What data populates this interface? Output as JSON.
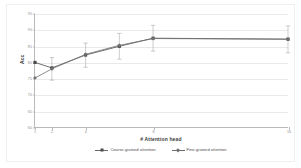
{
  "chart_data": {
    "type": "line",
    "title": "",
    "xlabel": "# Attention head",
    "ylabel": "Acc",
    "x": [
      1,
      2,
      4,
      6,
      8,
      16
    ],
    "xtick_labels": [
      "1",
      "2",
      "4",
      "8",
      "16"
    ],
    "xtick_positions": [
      1,
      2,
      4,
      8,
      16
    ],
    "ylim": [
      60,
      95
    ],
    "ytick_labels": [
      "95",
      "90",
      "85",
      "80",
      "75",
      "70",
      "65",
      "60"
    ],
    "ytick_values": [
      95,
      90,
      85,
      80,
      75,
      70,
      65,
      60
    ],
    "grid": true,
    "legend_position": "bottom",
    "series": [
      {
        "name": "Coarse-grained attention",
        "marker": "square",
        "color": "#4a4a4a",
        "values": [
          80.0,
          78.3,
          82.3,
          85.0,
          87.5,
          87.2
        ],
        "error_low": [
          80.0,
          74.5,
          78.5,
          81.0,
          83.5,
          83.0
        ],
        "error_high": [
          80.0,
          81.5,
          86.0,
          89.0,
          91.5,
          91.3
        ]
      },
      {
        "name": "Fine-grained attention",
        "marker": "diamond",
        "color": "#707070",
        "values": [
          75.2,
          78.0,
          82.5,
          85.3,
          87.4,
          87.2
        ],
        "error_low": [
          75.2,
          74.5,
          78.5,
          81.0,
          83.5,
          83.0
        ],
        "error_high": [
          75.2,
          81.5,
          86.0,
          89.0,
          91.5,
          91.3
        ]
      }
    ]
  },
  "legend": {
    "entries": [
      {
        "label": "Coarse-grained attention"
      },
      {
        "label": "Fine-grained attention"
      }
    ]
  },
  "axes": {
    "x_title": "# Attention head",
    "y_title": "Acc"
  }
}
